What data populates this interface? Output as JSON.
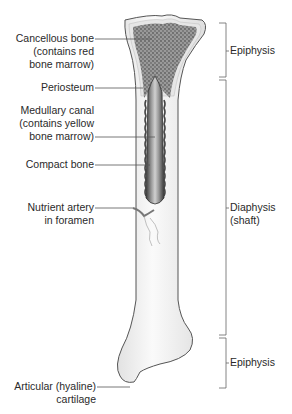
{
  "figure": {
    "type": "long-bone-anatomy",
    "colors": {
      "outline": "#555555",
      "spongy_fill": "#8a8a8a",
      "cortex": "#e4e4e4",
      "marrow_dark": "#3a3a3a",
      "marrow_light": "#bdbdbd",
      "shaft_fill": "#efefef",
      "leader_line": "#555555",
      "artery": "#7a7a7a"
    },
    "left_labels": [
      {
        "id": "cancellous",
        "lines": [
          "Cancellous bone",
          "(contains red",
          "bone marrow)"
        ]
      },
      {
        "id": "periosteum",
        "lines": [
          "Periosteum"
        ]
      },
      {
        "id": "medullary",
        "lines": [
          "Medullary canal",
          "(contains yellow",
          "bone marrow)"
        ]
      },
      {
        "id": "compact",
        "lines": [
          "Compact bone"
        ]
      },
      {
        "id": "nutrient",
        "lines": [
          "Nutrient artery",
          "in foramen"
        ]
      },
      {
        "id": "articular",
        "lines": [
          "Articular (hyaline)",
          "cartilage"
        ]
      }
    ],
    "right_labels": [
      {
        "id": "epiphysis-top",
        "lines": [
          "Epiphysis"
        ]
      },
      {
        "id": "diaphysis",
        "lines": [
          "Diaphysis",
          "(shaft)"
        ]
      },
      {
        "id": "epiphysis-bottom",
        "lines": [
          "Epiphysis"
        ]
      }
    ]
  }
}
